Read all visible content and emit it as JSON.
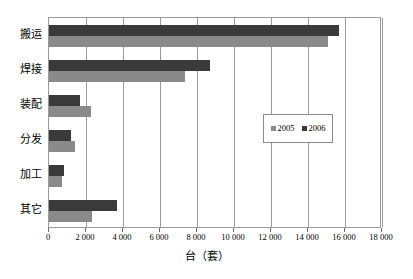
{
  "chart_data": {
    "type": "bar",
    "orientation": "horizontal",
    "title": "",
    "xlabel": "台（套）",
    "ylabel": "",
    "categories": [
      "搬运",
      "焊接",
      "装配",
      "分发",
      "加工",
      "其它"
    ],
    "series": [
      {
        "name": "2005",
        "color": "#8a8a8a",
        "values": [
          15100,
          7350,
          2250,
          1400,
          700,
          2350
        ]
      },
      {
        "name": "2006",
        "color": "#3a3a3a",
        "values": [
          15700,
          8700,
          1700,
          1200,
          800,
          3650
        ]
      }
    ],
    "xlim": [
      0,
      18000
    ],
    "xticks": [
      0,
      2000,
      4000,
      6000,
      8000,
      10000,
      12000,
      14000,
      16000,
      18000
    ],
    "xtick_labels": [
      "0",
      "2 000",
      "4 000",
      "6 000",
      "8 000",
      "10 000",
      "12 000",
      "14 000",
      "16 000",
      "18 000"
    ],
    "grid": "vertical",
    "legend": {
      "position": "inside-right",
      "entries": [
        {
          "label": "2005",
          "swatch": "legend-swatch-2005"
        },
        {
          "label": "2006",
          "swatch": "legend-swatch-2006"
        }
      ]
    }
  }
}
